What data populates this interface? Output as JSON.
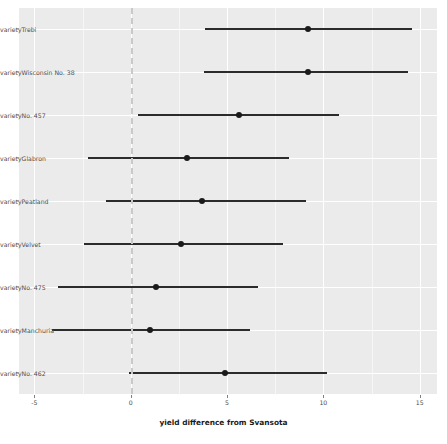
{
  "chart_data": {
    "type": "scatter",
    "subtype": "forest-plot",
    "title": "",
    "xlabel": "yield difference from Svansota",
    "ylabel": "",
    "xlim": [
      -5.8,
      15.9
    ],
    "xticks": [
      -5,
      0,
      5,
      10,
      15
    ],
    "xticklabels": [
      "-5",
      "0",
      "5",
      "10",
      "15"
    ],
    "grid": true,
    "legend": "none",
    "reference_line": 0,
    "reference_line_style": "dashed",
    "categories": [
      "varietyTrebi",
      "varietyWisconsin No. 38",
      "varietyNo. 457",
      "varietyGlabron",
      "varietyPeatland",
      "varietyVelvet",
      "varietyNo. 475",
      "varietyManchuria",
      "varietyNo. 462"
    ],
    "points": [
      {
        "label": "varietyTrebi",
        "estimate": 9.2,
        "low": 3.85,
        "high": 14.6
      },
      {
        "label": "varietyWisconsin No. 38",
        "estimate": 9.2,
        "low": 3.8,
        "high": 14.4
      },
      {
        "label": "varietyNo. 457",
        "estimate": 5.6,
        "low": 0.4,
        "high": 10.8
      },
      {
        "label": "varietyGlabron",
        "estimate": 2.9,
        "low": -2.2,
        "high": 8.2
      },
      {
        "label": "varietyPeatland",
        "estimate": 3.7,
        "low": -1.3,
        "high": 9.1
      },
      {
        "label": "varietyVelvet",
        "estimate": 2.6,
        "low": -2.4,
        "high": 7.9
      },
      {
        "label": "varietyNo. 475",
        "estimate": 1.3,
        "low": -3.8,
        "high": 6.6
      },
      {
        "label": "varietyManchuria",
        "estimate": 1.0,
        "low": -4.1,
        "high": 6.2
      },
      {
        "label": "varietyNo. 462",
        "estimate": 4.9,
        "low": -0.1,
        "high": 10.2
      }
    ],
    "colors": {
      "panel_background": "#ebebeb",
      "plot_background": "#ffffff",
      "gridline": "#ffffff",
      "point": "#1a1a1a",
      "interval": "#2b2b2b",
      "reference_line": "#c9c9c9",
      "axis_text": "#4d4d4d"
    }
  }
}
